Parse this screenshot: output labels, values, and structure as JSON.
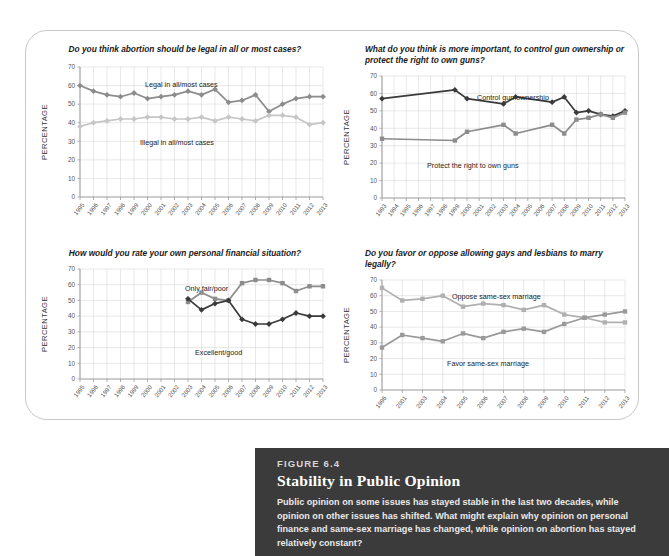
{
  "figure": {
    "kicker": "FIGURE 6.4",
    "title": "Stability in Public Opinion",
    "body": "Public opinion on some issues has stayed stable in the last two decades, while opinion on other issues has shifted. What might explain why opinion on personal finance and same-sex marriage has changed, while opinion on abortion has stayed relatively constant?"
  },
  "common": {
    "ylabel": "PERCENTAGE",
    "yticks": [
      0,
      10,
      20,
      30,
      40,
      50,
      60,
      70
    ]
  },
  "chart_data": [
    {
      "id": "abortion",
      "type": "line",
      "title": "Do you think abortion should be legal in all or most cases?",
      "xlabel": "",
      "ylabel": "PERCENTAGE",
      "ylim": [
        0,
        70
      ],
      "grid": true,
      "legend_position": "inline-annotation",
      "categories": [
        "1995",
        "1996",
        "1997",
        "1998",
        "1999",
        "2000",
        "2001",
        "2002",
        "2003",
        "2004",
        "2005",
        "2006",
        "2007",
        "2008",
        "2009",
        "2010",
        "2011",
        "2012",
        "2013"
      ],
      "series": [
        {
          "name": "Legal in all/most cases",
          "color": "#8c8c8c",
          "marker": "diamond",
          "values": [
            60,
            57,
            55,
            54,
            56,
            53,
            54,
            55,
            57,
            55,
            58,
            51,
            52,
            55,
            46,
            50,
            53,
            54,
            54
          ]
        },
        {
          "name": "Illegal in all/most cases",
          "color": "#c6c6c6",
          "marker": "diamond",
          "values": [
            38,
            40,
            41,
            42,
            42,
            43,
            43,
            42,
            42,
            43,
            41,
            43,
            42,
            41,
            44,
            44,
            43,
            39,
            40
          ]
        }
      ]
    },
    {
      "id": "guns",
      "type": "line",
      "title": "What do you think is more important, to control gun ownership or protect the right to own guns?",
      "xlabel": "",
      "ylabel": "PERCENTAGE",
      "ylim": [
        0,
        70
      ],
      "grid": true,
      "legend_position": "inline-annotation",
      "categories": [
        "1993",
        "1994",
        "1995",
        "1996",
        "1997",
        "1998",
        "1999",
        "2000",
        "2001",
        "2002",
        "2003",
        "2004",
        "2005",
        "2006",
        "2007",
        "2008",
        "2009",
        "2010",
        "2011",
        "2012",
        "2013"
      ],
      "series": [
        {
          "name": "Control gun ownership",
          "color": "#3a3a3a",
          "marker": "diamond",
          "values": [
            57,
            null,
            null,
            null,
            null,
            null,
            62,
            57,
            null,
            null,
            54,
            null,
            null,
            58,
            null,
            55,
            58,
            49,
            50,
            48,
            47,
            50
          ],
          "points": [
            {
              "x": "1993",
              "y": 57
            },
            {
              "x": "1999",
              "y": 62
            },
            {
              "x": "2000",
              "y": 57
            },
            {
              "x": "2003",
              "y": 54
            },
            {
              "x": "2004",
              "y": 58
            },
            {
              "x": "2007",
              "y": 55
            },
            {
              "x": "2008",
              "y": 58
            },
            {
              "x": "2009",
              "y": 49
            },
            {
              "x": "2010",
              "y": 50
            },
            {
              "x": "2011",
              "y": 48
            },
            {
              "x": "2012",
              "y": 47
            },
            {
              "x": "2013",
              "y": 50
            }
          ]
        },
        {
          "name": "Protect the right to own guns",
          "color": "#8c8c8c",
          "marker": "square",
          "points": [
            {
              "x": "1993",
              "y": 34
            },
            {
              "x": "1999",
              "y": 33
            },
            {
              "x": "2000",
              "y": 38
            },
            {
              "x": "2003",
              "y": 42
            },
            {
              "x": "2004",
              "y": 37
            },
            {
              "x": "2007",
              "y": 42
            },
            {
              "x": "2008",
              "y": 37
            },
            {
              "x": "2009",
              "y": 45
            },
            {
              "x": "2010",
              "y": 46
            },
            {
              "x": "2011",
              "y": 48
            },
            {
              "x": "2012",
              "y": 46
            },
            {
              "x": "2013",
              "y": 49
            }
          ]
        }
      ]
    },
    {
      "id": "finance",
      "type": "line",
      "title": "How would you rate your own personal financial situation?",
      "xlabel": "",
      "ylabel": "PERCENTAGE",
      "ylim": [
        0,
        70
      ],
      "grid": true,
      "legend_position": "inline-annotation",
      "categories": [
        "1995",
        "1996",
        "1997",
        "1998",
        "1999",
        "2000",
        "2001",
        "2002",
        "2003",
        "2004",
        "2005",
        "2006",
        "2007",
        "2008",
        "2009",
        "2010",
        "2011",
        "2012",
        "2013"
      ],
      "series": [
        {
          "name": "Only fair/poor",
          "color": "#8c8c8c",
          "marker": "square",
          "points": [
            {
              "x": "2003",
              "y": 49
            },
            {
              "x": "2004",
              "y": 55
            },
            {
              "x": "2005",
              "y": 51
            },
            {
              "x": "2006",
              "y": 50
            },
            {
              "x": "2007",
              "y": 61
            },
            {
              "x": "2008",
              "y": 63
            },
            {
              "x": "2009",
              "y": 63
            },
            {
              "x": "2010",
              "y": 61
            },
            {
              "x": "2011",
              "y": 56
            },
            {
              "x": "2012",
              "y": 59
            },
            {
              "x": "2013",
              "y": 59
            }
          ]
        },
        {
          "name": "Excellent/good",
          "color": "#3a3a3a",
          "marker": "diamond",
          "points": [
            {
              "x": "2003",
              "y": 51
            },
            {
              "x": "2004",
              "y": 44
            },
            {
              "x": "2005",
              "y": 48
            },
            {
              "x": "2006",
              "y": 50
            },
            {
              "x": "2007",
              "y": 38
            },
            {
              "x": "2008",
              "y": 35
            },
            {
              "x": "2009",
              "y": 35
            },
            {
              "x": "2010",
              "y": 38
            },
            {
              "x": "2011",
              "y": 42
            },
            {
              "x": "2012",
              "y": 40
            },
            {
              "x": "2013",
              "y": 40
            }
          ]
        }
      ]
    },
    {
      "id": "marriage",
      "type": "line",
      "title": "Do you favor or oppose allowing gays and lesbians to marry legally?",
      "xlabel": "",
      "ylabel": "PERCENTAGE",
      "ylim": [
        0,
        70
      ],
      "grid": true,
      "legend_position": "inline-annotation",
      "categories": [
        "1996",
        "2001",
        "2003",
        "2004",
        "2005",
        "2006",
        "2007",
        "2008",
        "2009",
        "2010",
        "2011",
        "2012",
        "2013"
      ],
      "series": [
        {
          "name": "Oppose same-sex marriage",
          "color": "#b0b0b0",
          "marker": "square",
          "values": [
            65,
            57,
            58,
            60,
            53,
            55,
            54,
            51,
            54,
            48,
            46,
            43,
            43
          ]
        },
        {
          "name": "Favor same-sex marriage",
          "color": "#9a9a9a",
          "marker": "square",
          "values": [
            27,
            35,
            33,
            31,
            36,
            33,
            37,
            39,
            37,
            42,
            46,
            48,
            50
          ]
        }
      ]
    }
  ],
  "annotations": {
    "abortion": [
      {
        "text": "Legal in all/most cases"
      },
      {
        "text": "Illegal in all/most cases"
      }
    ],
    "guns": [
      {
        "text": "Control gun ownership"
      },
      {
        "text": "Protect the right to own guns"
      }
    ],
    "finance": [
      {
        "text": "Only fair/poor"
      },
      {
        "text": "Excellent/good"
      }
    ],
    "marriage": [
      {
        "text": "Oppose same-sex marriage"
      },
      {
        "text": "Favor same-sex marriage"
      }
    ]
  }
}
